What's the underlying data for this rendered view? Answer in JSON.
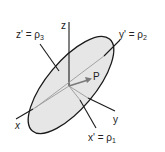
{
  "diagram": {
    "type": "3d-coordinate-ellipse",
    "labels": {
      "z_axis": "z",
      "y_axis": "y",
      "x_axis": "x",
      "z_prime": "z' = ρ",
      "z_prime_sub": "3",
      "y_prime": "y' = ρ",
      "y_prime_sub": "2",
      "x_prime": "x' = ρ",
      "x_prime_sub": "1",
      "point": "P"
    },
    "colors": {
      "line": "#1a1a1a",
      "ellipse_fill": "#e6e6e6",
      "vector": "#7a7a7a",
      "background": "#ffffff"
    }
  }
}
